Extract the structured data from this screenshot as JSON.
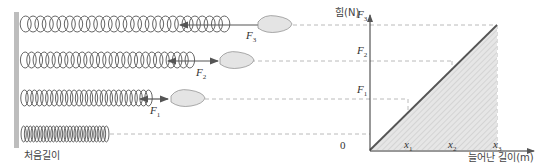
{
  "caption": {
    "initial_length": "처음길이"
  },
  "forces": [
    {
      "symbol": "F",
      "sub": "1"
    },
    {
      "symbol": "F",
      "sub": "2"
    },
    {
      "symbol": "F",
      "sub": "3"
    }
  ],
  "graph": {
    "y_axis_label": "힘(N)",
    "x_axis_label": "늘어난 길이(m)",
    "origin": "0",
    "y_ticks": [
      {
        "symbol": "F",
        "sub": "1"
      },
      {
        "symbol": "F",
        "sub": "2"
      },
      {
        "symbol": "F",
        "sub": "3"
      }
    ],
    "x_ticks": [
      {
        "symbol": "x",
        "sub": "1"
      },
      {
        "symbol": "x",
        "sub": "2"
      },
      {
        "symbol": "x",
        "sub": "3"
      }
    ]
  },
  "chart_data": {
    "type": "line",
    "title": "",
    "xlabel": "늘어난 길이(m)",
    "ylabel": "힘(N)",
    "x": [
      "0",
      "x1",
      "x2",
      "x3"
    ],
    "series": [
      {
        "name": "F = kx",
        "values": [
          "0",
          "F1",
          "F2",
          "F3"
        ]
      }
    ],
    "shaded_area": "triangle under line from 0 to x3",
    "grid": false
  },
  "colors": {
    "line": "#555555",
    "dash": "#999999",
    "shade": "#d8d8d8",
    "wall": "#bbbbbb"
  }
}
